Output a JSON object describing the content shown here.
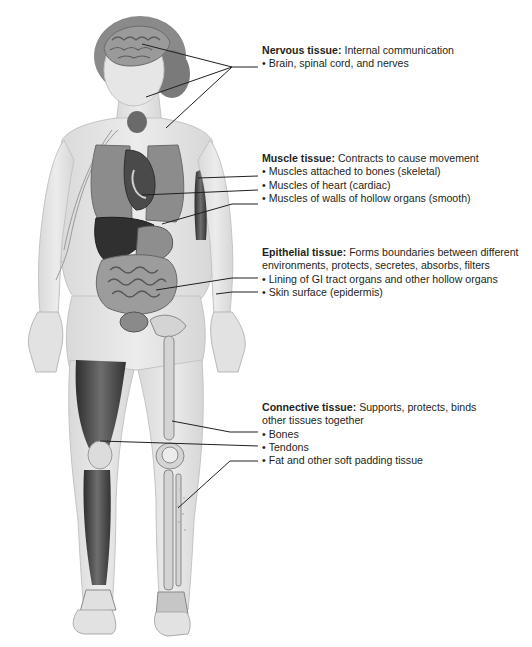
{
  "figure": {
    "palette": {
      "skin": "#e4e4e4",
      "skin_edge": "#cfcfcf",
      "organ_dark": "#3c3c3c",
      "organ_mid": "#777777",
      "organ_light": "#a9a9a9",
      "bone": "#d6d6d6",
      "muscle": "#4a4a4a",
      "leader_line": "#231f20",
      "text": "#231f20"
    }
  },
  "groups": [
    {
      "id": "nervous",
      "title": "Nervous tissue:",
      "description": "Internal communication",
      "items": [
        "Brain, spinal cord, and nerves"
      ]
    },
    {
      "id": "muscle",
      "title": "Muscle tissue:",
      "description": "Contracts to cause movement",
      "items": [
        "Muscles attached to bones (skeletal)",
        "Muscles of heart (cardiac)",
        "Muscles of walls of hollow organs (smooth)"
      ]
    },
    {
      "id": "epithelial",
      "title": "Epithelial tissue:",
      "description": "Forms boundaries between different environments, protects, secretes, absorbs, filters",
      "items": [
        "Lining of GI tract organs and other hollow organs",
        "Skin surface (epidermis)"
      ]
    },
    {
      "id": "connective",
      "title": "Connective tissue:",
      "description": "Supports, protects, binds other tissues together",
      "items": [
        "Bones",
        "Tendons",
        "Fat and other soft padding tissue"
      ]
    }
  ]
}
